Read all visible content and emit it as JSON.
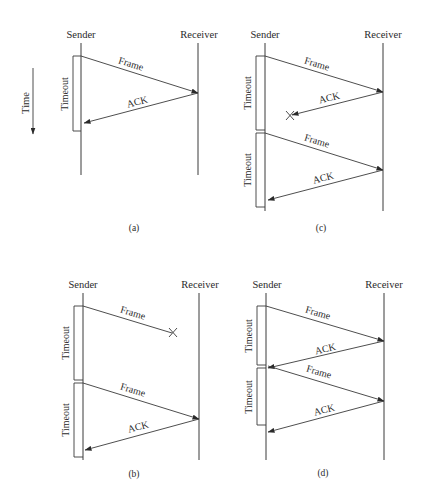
{
  "diagram": {
    "time_axis": {
      "label": "Time"
    },
    "panels": [
      {
        "id": "a",
        "caption": "(a)",
        "sender_label": "Sender",
        "receiver_label": "Receiver",
        "messages": [
          {
            "label": "Frame",
            "direction": "sender-to-receiver",
            "lost": false
          },
          {
            "label": "ACK",
            "direction": "receiver-to-sender",
            "lost": false
          }
        ],
        "timeouts": [
          {
            "label": "Timeout"
          }
        ]
      },
      {
        "id": "b",
        "caption": "(b)",
        "sender_label": "Sender",
        "receiver_label": "Receiver",
        "messages": [
          {
            "label": "Frame",
            "direction": "sender-to-receiver",
            "lost": true
          },
          {
            "label": "Frame",
            "direction": "sender-to-receiver",
            "lost": false
          },
          {
            "label": "ACK",
            "direction": "receiver-to-sender",
            "lost": false
          }
        ],
        "timeouts": [
          {
            "label": "Timeout"
          },
          {
            "label": "Timeout"
          }
        ]
      },
      {
        "id": "c",
        "caption": "(c)",
        "sender_label": "Sender",
        "receiver_label": "Receiver",
        "messages": [
          {
            "label": "Frame",
            "direction": "sender-to-receiver",
            "lost": false
          },
          {
            "label": "ACK",
            "direction": "receiver-to-sender",
            "lost": true
          },
          {
            "label": "Frame",
            "direction": "sender-to-receiver",
            "lost": false
          },
          {
            "label": "ACK",
            "direction": "receiver-to-sender",
            "lost": false
          }
        ],
        "timeouts": [
          {
            "label": "Timeout"
          },
          {
            "label": "Timeout"
          }
        ]
      },
      {
        "id": "d",
        "caption": "(d)",
        "sender_label": "Sender",
        "receiver_label": "Receiver",
        "messages": [
          {
            "label": "Frame",
            "direction": "sender-to-receiver",
            "lost": false
          },
          {
            "label": "ACK",
            "direction": "receiver-to-sender",
            "lost": false
          },
          {
            "label": "Frame",
            "direction": "sender-to-receiver",
            "lost": false
          },
          {
            "label": "ACK",
            "direction": "receiver-to-sender",
            "lost": false
          }
        ],
        "timeouts": [
          {
            "label": "Timeout"
          },
          {
            "label": "Timeout"
          }
        ]
      }
    ]
  }
}
